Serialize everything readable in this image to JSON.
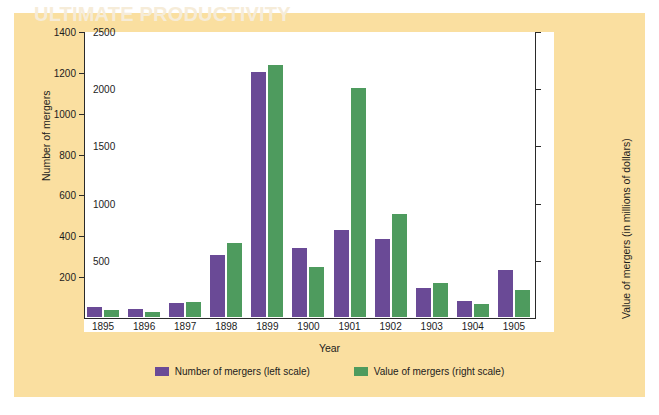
{
  "chart_data": {
    "type": "bar",
    "title": "",
    "xlabel": "Year",
    "ylabel_left": "Number of mergers",
    "ylabel_right": "Value of mergers (in millions of dollars)",
    "categories": [
      "1895",
      "1896",
      "1897",
      "1898",
      "1899",
      "1900",
      "1901",
      "1902",
      "1903",
      "1904",
      "1905"
    ],
    "series": [
      {
        "name": "Number of mergers (left scale)",
        "axis": "left",
        "color": "#6a4a96",
        "values": [
          50,
          40,
          70,
          305,
          1200,
          340,
          425,
          380,
          142,
          78,
          230
        ]
      },
      {
        "name": "Value of mergers (right scale)",
        "axis": "right",
        "color": "#4e9b5e",
        "values": [
          65,
          45,
          130,
          650,
          2200,
          440,
          2000,
          900,
          300,
          110,
          240
        ]
      }
    ],
    "ylim_left": [
      0,
      1400
    ],
    "ylim_right": [
      0,
      2500
    ],
    "yticks_left": [
      "200",
      "400",
      "600",
      "800",
      "1000",
      "1200",
      "1400"
    ],
    "ytick_values_left": [
      200,
      400,
      600,
      800,
      1000,
      1200,
      1400
    ],
    "yticks_right": [
      "500",
      "1000",
      "1500",
      "2000",
      "2500"
    ],
    "ytick_values_right": [
      500,
      1000,
      1500,
      2000,
      2500
    ],
    "grid": false,
    "legend_position": "bottom-center",
    "legend": [
      "Number of mergers (left scale)",
      "Value of mergers (right scale)"
    ]
  },
  "legend": {
    "purple_label": "Number of mergers (left scale)",
    "green_label": "Value of mergers (right scale)"
  },
  "axes": {
    "x_title": "Year",
    "y_left_title": "Number of mergers",
    "y_right_title": "Value of mergers (in millions of dollars)"
  },
  "colors": {
    "panel": "#fadfa0",
    "plot": "#ffffff",
    "purple": "#6a4a96",
    "green": "#4e9b5e",
    "axis": "#2a2a2a"
  },
  "background_text": {
    "header": "ULTIMATE PRODUCTIVITY",
    "author": "JOHN D. ROCKEFELLER",
    "title": "Explains the Incredible Right Products",
    "body_left": "the corporation in the",
    "body_right": "efficient"
  }
}
